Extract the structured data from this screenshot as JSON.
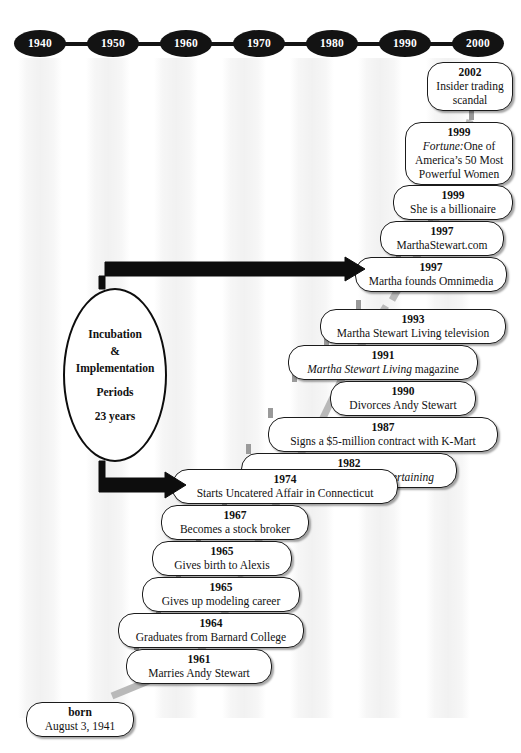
{
  "axis": {
    "label": "decade-axis",
    "decades": [
      "1940",
      "1950",
      "1960",
      "1970",
      "1980",
      "1990",
      "2000"
    ]
  },
  "period_marker": {
    "line1": "Incubation",
    "line2": "&",
    "line3": "Implementation",
    "line4": "Periods",
    "line5": "23 years"
  },
  "events": [
    {
      "year": "2002",
      "desc": "Insider trading scandal"
    },
    {
      "year": "1999",
      "desc": "Fortune:One of America’s 50 Most Powerful Women",
      "italic_prefix": "Fortune:",
      "rest": "One of America’s 50 Most Powerful Women"
    },
    {
      "year": "1999",
      "desc": "She is a billionaire"
    },
    {
      "year": "1997",
      "desc": "MarthaStewart.com"
    },
    {
      "year": "1997",
      "desc": "Martha founds Omnimedia"
    },
    {
      "year": "1993",
      "desc": "Martha Stewart Living television"
    },
    {
      "year": "1991",
      "desc": "Martha Stewart Living magazine",
      "italic_prefix": "Martha Stewart Living",
      "rest": " magazine"
    },
    {
      "year": "1990",
      "desc": "Divorces Andy Stewart"
    },
    {
      "year": "1987",
      "desc": "Signs a $5-million contract with K-Mart"
    },
    {
      "year": "1982",
      "desc": "Publishes her first book Entertaining",
      "plain_prefix": "Publishes her first book ",
      "italic_suffix": "Entertaining"
    },
    {
      "year": "1974",
      "desc": "Starts Uncatered Affair in Connecticut"
    },
    {
      "year": "1967",
      "desc": "Becomes a stock broker"
    },
    {
      "year": "1965",
      "desc": "Gives birth to Alexis"
    },
    {
      "year": "1965",
      "desc": "Gives up modeling career"
    },
    {
      "year": "1964",
      "desc": "Graduates from Barnard College"
    },
    {
      "year": "1961",
      "desc": "Marries Andy Stewart"
    },
    {
      "year": "born",
      "desc": "August 3, 1941"
    }
  ],
  "colors": {
    "node_fill": "#131313",
    "node_text": "#ffffff",
    "box_border": "#1b1b1b",
    "ribbon": "#b3b3b3",
    "arrow": "#0d0d0d",
    "band": "#f0f0f0"
  }
}
